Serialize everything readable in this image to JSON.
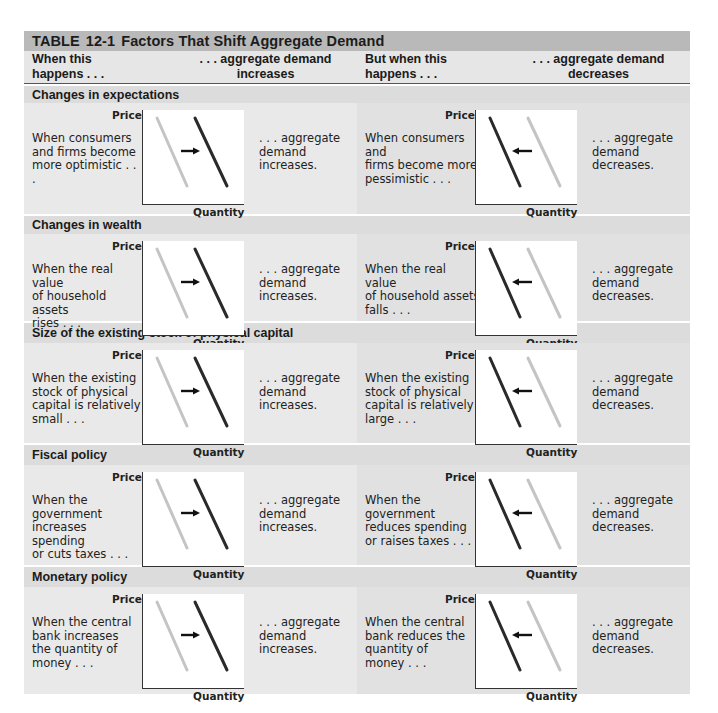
{
  "table": {
    "title_prefix": "TABLE",
    "title_number": "12-1",
    "title_text": "Factors That Shift Aggregate Demand"
  },
  "header": {
    "col1": "When this\nhappens . . .",
    "col2": ". . . aggregate demand\nincreases",
    "col3": "But when this\nhappens . . .",
    "col4": ". . . aggregate demand\ndecreases"
  },
  "axes": {
    "y_label": "Price",
    "x_label": "Quantity"
  },
  "colors": {
    "title_bar": "#b9b9b9",
    "header_bg": "#e6e6e6",
    "section_label_bg": "#dcdcdc",
    "left_bg": "#e9e9e9",
    "right_bg": "#e1e1e1",
    "old_curve": "#c4c4c4",
    "new_curve": "#2a2a2a",
    "arrow": "#111111"
  },
  "sections": [
    {
      "label": "Changes in expectations",
      "increase_cause": "When consumers\nand firms become\nmore optimistic . . .",
      "increase_result": ". . . aggregate\ndemand increases.",
      "decrease_cause": "When consumers and\nfirms become more\npessimistic . . .",
      "decrease_result": ". . . aggregate\ndemand decreases."
    },
    {
      "label": "Changes in wealth",
      "increase_cause": "When the real value\nof household assets\nrises . . .",
      "increase_result": ". . . aggregate\ndemand increases.",
      "decrease_cause": "When the real value\nof household assets\nfalls . . .",
      "decrease_result": ". . . aggregate\ndemand decreases."
    },
    {
      "label": "Size of the existing stock of physical capital",
      "increase_cause": "When the existing\nstock of physical\ncapital is relatively\nsmall . . .",
      "increase_result": ". . . aggregate\ndemand increases.",
      "decrease_cause": "When the existing\nstock of physical\ncapital is relatively\nlarge . . .",
      "decrease_result": ". . . aggregate\ndemand decreases."
    },
    {
      "label": "Fiscal policy",
      "increase_cause": "When the\ngovernment\nincreases spending\nor cuts taxes . . .",
      "increase_result": ". . . aggregate\ndemand increases.",
      "decrease_cause": "When the\ngovernment\nreduces spending\nor raises taxes . . .",
      "decrease_result": ". . . aggregate\ndemand decreases."
    },
    {
      "label": "Monetary policy",
      "increase_cause": "When the central\nbank increases\nthe quantity of\nmoney . . .",
      "increase_result": ". . . aggregate\ndemand increases.",
      "decrease_cause": "When the central\nbank reduces the\nquantity of\nmoney . . .",
      "decrease_result": ". . . aggregate\ndemand decreases."
    }
  ]
}
